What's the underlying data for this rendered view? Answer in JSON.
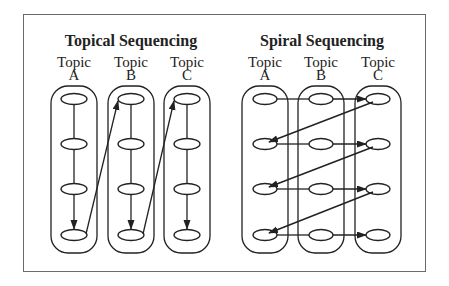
{
  "panels": [
    {
      "title": "Topical Sequencing",
      "topics": [
        {
          "label": "Topic",
          "letter": "A"
        },
        {
          "label": "Topic",
          "letter": "B"
        },
        {
          "label": "Topic",
          "letter": "C"
        }
      ],
      "description": "Each topic column is completed top to bottom (4 steps), then an arrow jumps from the bottom of one topic to the top of the next."
    },
    {
      "title": "Spiral Sequencing",
      "topics": [
        {
          "label": "Topic",
          "letter": "A"
        },
        {
          "label": "Topic",
          "letter": "B"
        },
        {
          "label": "Topic",
          "letter": "C"
        }
      ],
      "description": "Each row visits Topic A, B, then C; diagonal arrows return from C to A on the next row (4 rows)."
    }
  ],
  "colors": {
    "stroke": "#222222",
    "frame": "#6a6a6a",
    "background": "#ffffff"
  }
}
